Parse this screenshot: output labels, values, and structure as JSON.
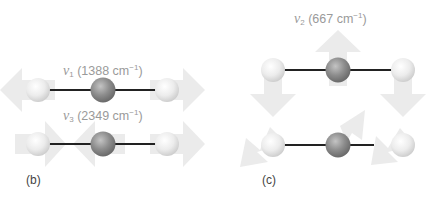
{
  "figure": {
    "panels": [
      {
        "id": "b",
        "label": "(b)",
        "modes": [
          {
            "symbol": "ν",
            "subscript": "1",
            "value": "(1388 cm",
            "unit_exp": "−1",
            "close": ")"
          },
          {
            "symbol": "ν",
            "subscript": "3",
            "value": "(2349 cm",
            "unit_exp": "−1",
            "close": ")"
          }
        ]
      },
      {
        "id": "c",
        "label": "(c)",
        "modes": [
          {
            "symbol": "ν",
            "subscript": "2",
            "value": "(667 cm",
            "unit_exp": "−1",
            "close": ")"
          }
        ]
      }
    ],
    "colors": {
      "arrow": "#ebebeb",
      "bond": "#222222",
      "oxygen_atom": "#e6e6e6",
      "carbon_atom": "#8c8c8c",
      "label_text": "#9a9a9a"
    }
  }
}
